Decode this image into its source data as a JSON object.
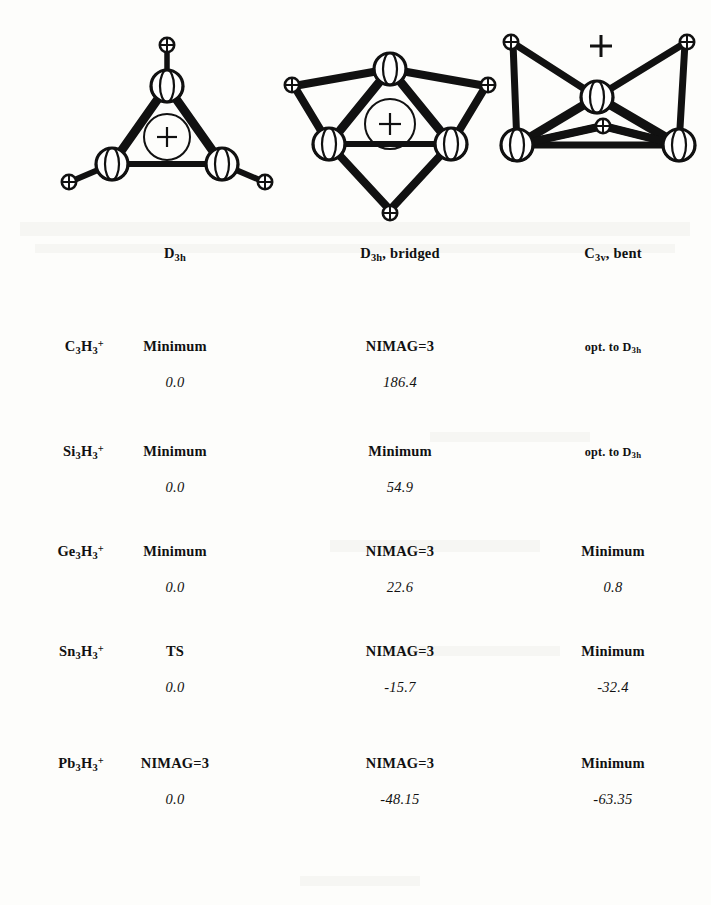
{
  "figure": {
    "structures": [
      {
        "id": "d3h",
        "name": "D3h cyclic trihydride cation",
        "charge_symbol": "+",
        "charge_style": "circled",
        "heavy_atoms": 3,
        "hydrogens": 3,
        "hydrogen_mode": "terminal"
      },
      {
        "id": "d3h-bridged",
        "name": "D3h bridged trihydride cation",
        "charge_symbol": "+",
        "charge_style": "circled",
        "heavy_atoms": 3,
        "hydrogens": 3,
        "hydrogen_mode": "edge-bridging"
      },
      {
        "id": "c3v-bent",
        "name": "C3v bent trihydride cation",
        "charge_symbol": "+",
        "charge_style": "plain",
        "heavy_atoms": 3,
        "hydrogens": 3,
        "hydrogen_mode": "terminal-pyramidal"
      }
    ]
  },
  "table": {
    "columns": [
      {
        "key": "label",
        "label": ""
      },
      {
        "key": "d3h",
        "label_html": "D<sub>3h</sub>",
        "label_text": "D3h"
      },
      {
        "key": "bridged",
        "label_html": "D<sub>3h</sub>, bridged",
        "label_text": "D3h, bridged"
      },
      {
        "key": "bent",
        "label_html": "C<sub>3v</sub>, bent",
        "label_text": "C3v, bent"
      }
    ],
    "rows": [
      {
        "label_html": "C<sub>3</sub>H<sub>3</sub><sup>+</sup>",
        "label_text": "C3H3+",
        "d3h": {
          "status": "Minimum",
          "energy": "0.0",
          "small": false
        },
        "bridged": {
          "status": "NIMAG=3",
          "energy": "186.4",
          "small": false
        },
        "bent": {
          "status": "opt. to D3h",
          "status_html": "opt. to D<sub>3h</sub>",
          "energy": "",
          "small": true
        }
      },
      {
        "label_html": "Si<sub>3</sub>H<sub>3</sub><sup>+</sup>",
        "label_text": "Si3H3+",
        "d3h": {
          "status": "Minimum",
          "energy": "0.0",
          "small": false
        },
        "bridged": {
          "status": "Minimum",
          "energy": "54.9",
          "small": false
        },
        "bent": {
          "status": "opt. to D3h",
          "status_html": "opt. to D<sub>3h</sub>",
          "energy": "",
          "small": true
        }
      },
      {
        "label_html": "Ge<sub>3</sub>H<sub>3</sub><sup>+</sup>",
        "label_text": "Ge3H3+",
        "d3h": {
          "status": "Minimum",
          "energy": "0.0",
          "small": false
        },
        "bridged": {
          "status": "NIMAG=3",
          "energy": "22.6",
          "small": false
        },
        "bent": {
          "status": "Minimum",
          "energy": "0.8",
          "small": false
        }
      },
      {
        "label_html": "Sn<sub>3</sub>H<sub>3</sub><sup>+</sup>",
        "label_text": "Sn3H3+",
        "d3h": {
          "status": "TS",
          "energy": "0.0",
          "small": false
        },
        "bridged": {
          "status": "NIMAG=3",
          "energy": "-15.7",
          "small": false
        },
        "bent": {
          "status": "Minimum",
          "energy": "-32.4",
          "small": false
        }
      },
      {
        "label_html": "Pb<sub>3</sub>H<sub>3</sub><sup>+</sup>",
        "label_text": "Pb3H3+",
        "d3h": {
          "status": "NIMAG=3",
          "energy": "0.0",
          "small": false
        },
        "bridged": {
          "status": "NIMAG=3",
          "energy": "-48.15",
          "small": false
        },
        "bent": {
          "status": "Minimum",
          "energy": "-63.35",
          "small": false
        }
      }
    ]
  },
  "colors": {
    "ink": "#111111",
    "paper": "#fdfdfb",
    "speckle": "#f1f0ec"
  }
}
